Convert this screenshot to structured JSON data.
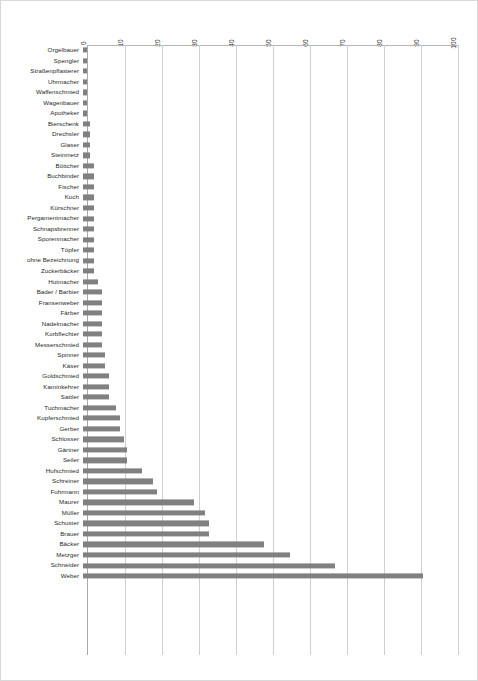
{
  "chart_data": {
    "type": "bar",
    "orientation": "horizontal",
    "title": "",
    "xlabel": "",
    "ylabel": "",
    "xlim": [
      0,
      100
    ],
    "xticks": [
      "0",
      "10",
      "20",
      "30",
      "40",
      "50",
      "60",
      "70",
      "80",
      "90",
      "100"
    ],
    "grid": true,
    "legend": false,
    "bar_color": "#808080",
    "categories": [
      "Orgelbauer",
      "Spengler",
      "Straßenpflasterer",
      "Uhrmacher",
      "Waffenschmied",
      "Wagenbauer",
      "Apotheker",
      "Bierschenk",
      "Drechsler",
      "Glaser",
      "Steinmetz",
      "Böttcher",
      "Buchbinder",
      "Fischer",
      "Koch",
      "Kürschner",
      "Pergamentmacher",
      "Schnapsbrenner",
      "Sporenmacher",
      "Töpfer",
      "ohne Bezeichnung",
      "Zuckerbäcker",
      "Hutmacher",
      "Bader / Barbier",
      "Fransenweber",
      "Färber",
      "Nadelmacher",
      "Korbflechter",
      "Messerschmied",
      "Spinner",
      "Käser",
      "Goldschmied",
      "Kaminkehrer",
      "Sattler",
      "Tuchmacher",
      "Kupferschmied",
      "Gerber",
      "Schlosser",
      "Gärtner",
      "Seiler",
      "Hufschmied",
      "Schreiner",
      "Fuhrmann",
      "Maurer",
      "Müller",
      "Schuster",
      "Brauer",
      "Bäcker",
      "Metzger",
      "Schneider",
      "Weber"
    ],
    "values": [
      1,
      1,
      1,
      1,
      1,
      1,
      1,
      2,
      2,
      2,
      2,
      3,
      3,
      3,
      3,
      3,
      3,
      3,
      3,
      3,
      3,
      3,
      4,
      5,
      5,
      5,
      5,
      5,
      5,
      6,
      6,
      7,
      7,
      7,
      9,
      10,
      10,
      11,
      12,
      12,
      16,
      19,
      20,
      30,
      33,
      34,
      34,
      49,
      56,
      68,
      92
    ]
  }
}
